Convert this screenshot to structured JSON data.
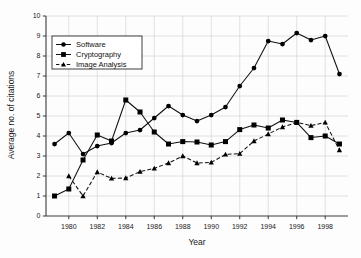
{
  "chart_data": {
    "type": "line",
    "title": "",
    "xlabel": "Year",
    "ylabel": "Average no. of citations",
    "xlim": [
      1978.4,
      1999.6
    ],
    "ylim": [
      0,
      10
    ],
    "xticks": [
      1980,
      1982,
      1984,
      1986,
      1988,
      1990,
      1992,
      1994,
      1996,
      1998
    ],
    "xticklabels": [
      "1980",
      "1982",
      "1984",
      "1986",
      "1988",
      "1990",
      "1992",
      "1994",
      "1996",
      "1998"
    ],
    "yticks": [
      0,
      1,
      2,
      3,
      4,
      5,
      6,
      7,
      8,
      9,
      10
    ],
    "yticklabels": [
      "0",
      "1",
      "2",
      "3",
      "4",
      "5",
      "6",
      "7",
      "8",
      "9",
      "10"
    ],
    "grid": true,
    "legend_position": "upper-left",
    "x": [
      1979,
      1980,
      1981,
      1982,
      1983,
      1984,
      1985,
      1986,
      1987,
      1988,
      1989,
      1990,
      1991,
      1992,
      1993,
      1994,
      1995,
      1996,
      1997,
      1998,
      1999
    ],
    "series": [
      {
        "name": "Software",
        "marker": "circle",
        "linestyle": "solid",
        "color": "#000000",
        "values": [
          3.6,
          4.15,
          3.1,
          3.5,
          3.65,
          4.15,
          4.3,
          4.9,
          5.5,
          5.05,
          4.75,
          5.05,
          5.45,
          6.5,
          7.4,
          8.75,
          8.6,
          9.15,
          8.8,
          9.0,
          7.1
        ]
      },
      {
        "name": "Cryptography",
        "marker": "square",
        "linestyle": "solid",
        "color": "#000000",
        "values": [
          1.0,
          1.35,
          2.8,
          4.05,
          3.75,
          5.8,
          5.2,
          4.2,
          3.6,
          3.72,
          3.7,
          3.55,
          3.72,
          4.32,
          4.55,
          4.4,
          4.8,
          4.68,
          3.92,
          4.0,
          3.6
        ]
      },
      {
        "name": "Image Analysis",
        "marker": "triangle",
        "linestyle": "dashed",
        "color": "#000000",
        "values": [
          null,
          2.0,
          1.0,
          2.2,
          1.88,
          1.9,
          2.22,
          2.38,
          2.65,
          3.0,
          2.65,
          2.68,
          3.08,
          3.12,
          3.75,
          4.1,
          4.45,
          4.68,
          4.52,
          4.68,
          3.3
        ]
      }
    ]
  },
  "legend": {
    "items": [
      {
        "label": "Software",
        "marker": "circle",
        "linestyle": "solid"
      },
      {
        "label": "Cryptography",
        "marker": "square",
        "linestyle": "solid"
      },
      {
        "label": "Image Analysis",
        "marker": "triangle",
        "linestyle": "dashed"
      }
    ]
  },
  "axes": {
    "x_title": "Year",
    "y_title": "Average no. of citations"
  }
}
